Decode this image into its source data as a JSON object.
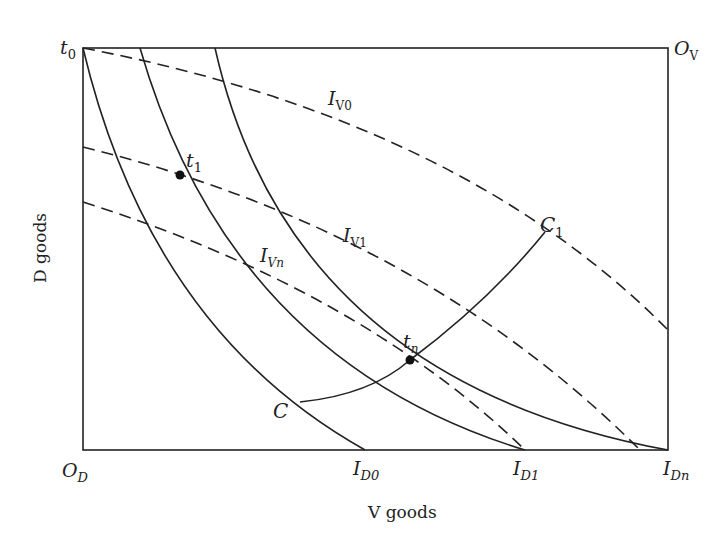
{
  "diagram": {
    "type": "edgeworth-box",
    "axes": {
      "x_label": "V goods",
      "y_label": "D goods"
    },
    "corners": {
      "top_left": {
        "main": "t",
        "sub": "0"
      },
      "top_right": {
        "main": "O",
        "sub": "V"
      },
      "bottom_left": {
        "main": "O",
        "sub": "D"
      }
    },
    "d_indifference_curves": [
      {
        "main": "I",
        "sub": "D0",
        "style": "solid"
      },
      {
        "main": "I",
        "sub": "D1",
        "style": "solid"
      },
      {
        "main": "I",
        "sub": "Dn",
        "style": "solid"
      }
    ],
    "v_indifference_curves": [
      {
        "main": "I",
        "sub": "V0",
        "style": "dashed"
      },
      {
        "main": "I",
        "sub": "V1",
        "style": "dashed"
      },
      {
        "main": "I",
        "sub": "Vn",
        "style": "dashed"
      }
    ],
    "points": [
      {
        "main": "t",
        "sub": "1"
      },
      {
        "main": "t",
        "sub": "n"
      }
    ],
    "contract_curve": {
      "start_label": "C",
      "end_label": {
        "main": "C",
        "sub": "1"
      }
    },
    "colors": {
      "line": "#222222",
      "background": "#ffffff"
    }
  }
}
